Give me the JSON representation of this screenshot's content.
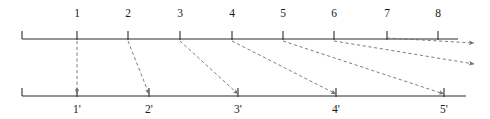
{
  "diagram": {
    "colors": {
      "axis": "#2b2b2b",
      "dashed": "#6e6e6e",
      "label": "#1a1a1a",
      "background": "#ffffff"
    },
    "top_axis": {
      "name": "upper-timeline",
      "x_start": 22,
      "x_end": 458,
      "y": 39,
      "end_caps": [
        "left"
      ],
      "ticks": [
        {
          "label": "1",
          "x": 77
        },
        {
          "label": "2",
          "x": 128
        },
        {
          "label": "3",
          "x": 180
        },
        {
          "label": "4",
          "x": 232
        },
        {
          "label": "5",
          "x": 283
        },
        {
          "label": "6",
          "x": 334
        },
        {
          "label": "7",
          "x": 387
        },
        {
          "label": "8",
          "x": 438
        }
      ],
      "label_y": 17,
      "tick_up": 8,
      "tick_down": 0
    },
    "bottom_axis": {
      "name": "lower-timeline",
      "x_start": 22,
      "x_end": 466,
      "y": 96,
      "end_caps": [
        "left"
      ],
      "ticks": [
        {
          "label": "1'",
          "x": 77
        },
        {
          "label": "2'",
          "x": 149
        },
        {
          "label": "3'",
          "x": 238
        },
        {
          "label": "4'",
          "x": 336
        },
        {
          "label": "5'",
          "x": 444
        }
      ],
      "label_y": 113,
      "tick_up": 8,
      "tick_down": 0
    },
    "mappings": [
      {
        "name": "map-1-to-1prime",
        "from_label": "1",
        "to_label": "1'",
        "x1": 77,
        "y1": 41,
        "x2": 77,
        "y2": 94,
        "arrow": true
      },
      {
        "name": "map-2-to-2prime",
        "from_label": "2",
        "to_label": "2'",
        "x1": 128,
        "y1": 41,
        "x2": 149,
        "y2": 94,
        "arrow": true
      },
      {
        "name": "map-3-to-3prime",
        "from_label": "3",
        "to_label": "3'",
        "x1": 180,
        "y1": 41,
        "x2": 238,
        "y2": 94,
        "arrow": true
      },
      {
        "name": "map-4-to-4prime",
        "from_label": "4",
        "to_label": "4'",
        "x1": 232,
        "y1": 41,
        "x2": 336,
        "y2": 94,
        "arrow": true
      },
      {
        "name": "map-5-to-5prime",
        "from_label": "5",
        "to_label": "5'",
        "x1": 283,
        "y1": 41,
        "x2": 444,
        "y2": 94,
        "arrow": true
      },
      {
        "name": "map-6-to-offright-lower",
        "from_label": "6",
        "to_label": "",
        "x1": 334,
        "y1": 41,
        "x2": 474,
        "y2": 64,
        "arrow": true
      },
      {
        "name": "map-7-to-offright-upper",
        "from_label": "7",
        "to_label": "",
        "x1": 387,
        "y1": 38,
        "x2": 474,
        "y2": 43,
        "arrow": true
      }
    ]
  }
}
